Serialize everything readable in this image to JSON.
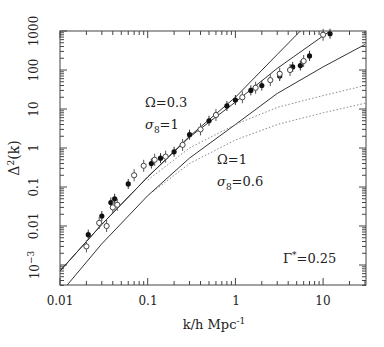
{
  "chart_data": {
    "type": "line",
    "title": "",
    "xlabel": "k/h Mpc^-1",
    "ylabel": "Δ²(k)",
    "xscale": "log",
    "yscale": "log",
    "xlim": [
      0.01,
      30
    ],
    "ylim": [
      0.0003,
      1000
    ],
    "x_ticks": [
      "0.01",
      "0.1",
      "1",
      "10"
    ],
    "y_ticks": [
      "10^-3",
      "0.01",
      "0.1",
      "1",
      "10",
      "100",
      "1000"
    ],
    "annotations": [
      {
        "text": "Ω=0.3",
        "sub": "σ8=1"
      },
      {
        "text": "Ω=1",
        "sub": "σ8=0.6"
      },
      {
        "text": "Γ*=0.25"
      }
    ],
    "series": [
      {
        "name": "linear Ω=0.3 σ8=1 (upper solid)",
        "style": "solid",
        "x": [
          0.01,
          0.03,
          0.1,
          0.3,
          1,
          3,
          5.5
        ],
        "y": [
          0.0007,
          0.011,
          0.18,
          2.0,
          20,
          250,
          1000
        ]
      },
      {
        "name": "nonlinear Ω=0.3 (middle solid)",
        "style": "solid",
        "x": [
          0.01,
          0.03,
          0.1,
          0.3,
          1,
          3,
          12
        ],
        "y": [
          0.0007,
          0.011,
          0.18,
          1.9,
          15,
          110,
          1000
        ]
      },
      {
        "name": "Ω=1 σ8=0.6 (lower solid)",
        "style": "solid",
        "x": [
          0.012,
          0.03,
          0.1,
          0.3,
          1,
          3,
          10,
          30
        ],
        "y": [
          0.0003,
          0.0035,
          0.06,
          0.55,
          4,
          25,
          120,
          450
        ]
      },
      {
        "name": "linear Ω=0.3 (upper dotted)",
        "style": "dotted",
        "x": [
          0.1,
          0.3,
          1,
          3,
          10,
          30
        ],
        "y": [
          0.15,
          1.0,
          4.0,
          11,
          22,
          40
        ]
      },
      {
        "name": "linear Ω=1 (lower dotted)",
        "style": "dotted",
        "x": [
          0.1,
          0.3,
          1,
          3,
          10,
          30
        ],
        "y": [
          0.06,
          0.4,
          1.6,
          4.0,
          8,
          14
        ]
      }
    ],
    "points": {
      "filled": [
        [
          0.021,
          0.006
        ],
        [
          0.03,
          0.018
        ],
        [
          0.038,
          0.04
        ],
        [
          0.042,
          0.05
        ],
        [
          0.06,
          0.12
        ],
        [
          0.11,
          0.4
        ],
        [
          0.14,
          0.55
        ],
        [
          0.2,
          0.8
        ],
        [
          0.3,
          2.2
        ],
        [
          0.5,
          5
        ],
        [
          0.8,
          12
        ],
        [
          1.0,
          17
        ],
        [
          1.5,
          30
        ],
        [
          2.0,
          40
        ],
        [
          3.2,
          70
        ],
        [
          4.5,
          120
        ],
        [
          5.5,
          130
        ],
        [
          7,
          230
        ],
        [
          12,
          850
        ]
      ],
      "open": [
        [
          0.02,
          0.003
        ],
        [
          0.028,
          0.012
        ],
        [
          0.034,
          0.01
        ],
        [
          0.04,
          0.03
        ],
        [
          0.045,
          0.035
        ],
        [
          0.07,
          0.2
        ],
        [
          0.09,
          0.35
        ],
        [
          0.12,
          0.5
        ],
        [
          0.16,
          0.6
        ],
        [
          0.25,
          1.2
        ],
        [
          0.4,
          3
        ],
        [
          0.6,
          7
        ],
        [
          1.2,
          20
        ],
        [
          1.7,
          35
        ],
        [
          2.5,
          55
        ],
        [
          3.2,
          80
        ],
        [
          4.2,
          100
        ],
        [
          6,
          170
        ],
        [
          10,
          800
        ]
      ]
    }
  },
  "axes": {
    "xlabel": "k/h Mpc",
    "xlabel_sup": "-1",
    "ylabel": "Δ",
    "ylabel_sup": "2",
    "ylabel_tail": "(k)",
    "x_ticks": [
      "0.01",
      "0.1",
      "1",
      "10"
    ],
    "y_ticks": [
      "1000",
      "100",
      "10",
      "1",
      "0.1",
      "0.01"
    ],
    "y_tick_exp_base": "10",
    "y_tick_exp": "−3"
  },
  "annotations": {
    "a1_omega": "Ω=0.3",
    "a1_sigma": "σ",
    "a1_sigma_sub": "8",
    "a1_sigma_val": "=1",
    "a2_omega": "Ω=1",
    "a2_sigma": "σ",
    "a2_sigma_sub": "8",
    "a2_sigma_val": "=0.6",
    "gamma": "Γ",
    "gamma_sup": "*",
    "gamma_val": "=0.25"
  }
}
